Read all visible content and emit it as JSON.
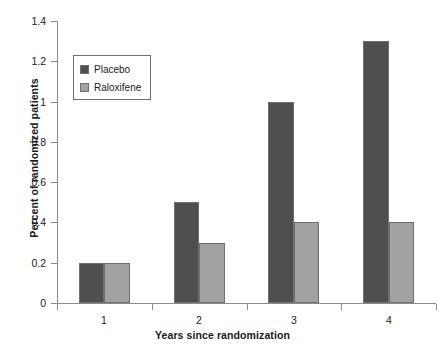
{
  "chart_data": {
    "type": "bar",
    "title": "",
    "subtitle": "",
    "xlabel": "Years since randomization",
    "ylabel": "Percent of randomized patients",
    "categories": [
      "1",
      "2",
      "3",
      "4"
    ],
    "series": [
      {
        "name": "Placebo",
        "color": "#4f4f4f",
        "values": [
          0.2,
          0.5,
          1.0,
          1.3
        ]
      },
      {
        "name": "Raloxifene",
        "color": "#a2a2a2",
        "values": [
          0.2,
          0.3,
          0.4,
          0.4
        ]
      }
    ],
    "ylim": [
      0,
      1.4
    ],
    "yticks": [
      "0",
      "0.2",
      "0.4",
      "0.6",
      "0.8",
      "1",
      "1.2",
      "1.4"
    ],
    "ytick_values": [
      0,
      0.2,
      0.4,
      0.6,
      0.8,
      1.0,
      1.2,
      1.4
    ],
    "xticks": [
      "1",
      "2",
      "3",
      "4"
    ],
    "grid": false,
    "legend_position": "upper-left",
    "legend_entries": [
      "Placebo",
      "Raloxifene"
    ],
    "annotations": []
  },
  "legend": {
    "items": [
      {
        "label": "Placebo"
      },
      {
        "label": "Raloxifene"
      }
    ]
  },
  "axes": {
    "y_title": "Percent of randomized patients",
    "x_title": "Years since randomization"
  }
}
